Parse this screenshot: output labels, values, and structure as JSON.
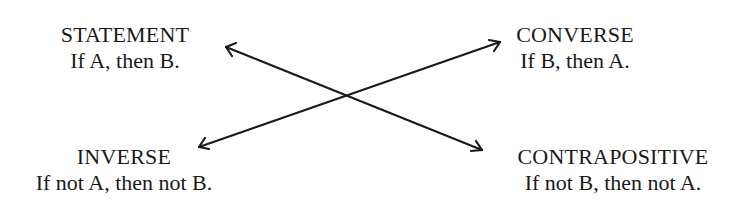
{
  "diagram": {
    "nodes": [
      {
        "id": "statement",
        "title": "STATEMENT",
        "text": "If A, then B."
      },
      {
        "id": "converse",
        "title": "CONVERSE",
        "text": "If B, then A."
      },
      {
        "id": "inverse",
        "title": "INVERSE",
        "text": "If not A, then not B."
      },
      {
        "id": "contrapositive",
        "title": "CONTRAPOSITIVE",
        "text": "If not B, then not A."
      }
    ],
    "edges": [
      {
        "from": "statement",
        "to": "contrapositive",
        "bidirectional": true
      },
      {
        "from": "inverse",
        "to": "converse",
        "bidirectional": true
      }
    ],
    "colors": {
      "line": "#1a1a1a",
      "background": "#ffffff"
    }
  }
}
